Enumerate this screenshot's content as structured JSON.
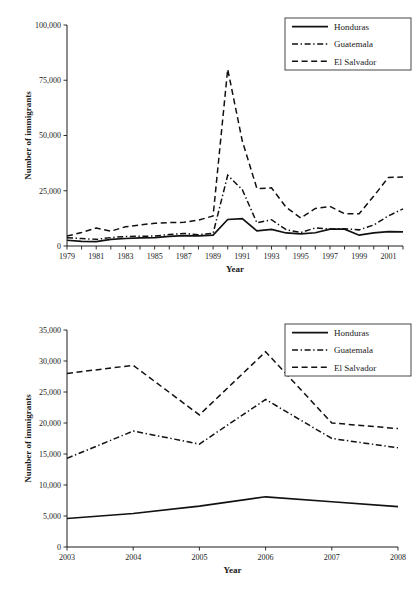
{
  "chart_data": [
    {
      "id": "top",
      "type": "line",
      "title": "",
      "xlabel": "Year",
      "ylabel": "Number of immigrants",
      "xlim": [
        1979,
        2002
      ],
      "ylim": [
        0,
        100000
      ],
      "ytick_labels": [
        "0",
        "25,000",
        "50,000",
        "75,000",
        "100,000"
      ],
      "ytick_values": [
        0,
        25000,
        50000,
        75000,
        100000
      ],
      "x": [
        1979,
        1980,
        1981,
        1982,
        1983,
        1984,
        1985,
        1986,
        1987,
        1988,
        1989,
        1990,
        1991,
        1992,
        1993,
        1994,
        1995,
        1996,
        1997,
        1998,
        1999,
        2000,
        2001,
        2002
      ],
      "xtick_labels": [
        "1979",
        "",
        "1981",
        "",
        "1983",
        "",
        "1985",
        "",
        "1987",
        "",
        "1989",
        "",
        "1991",
        "",
        "1993",
        "",
        "1995",
        "",
        "1997",
        "",
        "1999",
        "",
        "2001",
        ""
      ],
      "grid": false,
      "legend_position": "top-right",
      "series": [
        {
          "name": "Honduras",
          "style": "solid",
          "values": [
            2600,
            2100,
            2000,
            3000,
            3400,
            3700,
            3800,
            4400,
            4700,
            4600,
            4900,
            12000,
            12400,
            6800,
            7500,
            5900,
            5500,
            6000,
            7600,
            7600,
            4900,
            5900,
            6500,
            6400
          ]
        },
        {
          "name": "Guatemala",
          "style": "dashdot",
          "values": [
            3700,
            3400,
            3000,
            3800,
            4300,
            4400,
            4500,
            5200,
            5700,
            5100,
            5700,
            32000,
            25500,
            10500,
            11900,
            7400,
            6100,
            8200,
            7700,
            7800,
            7300,
            9500,
            13600,
            16800
          ]
        },
        {
          "name": "El Salvador",
          "style": "dashed",
          "values": [
            4500,
            6100,
            8100,
            6700,
            8700,
            9500,
            10300,
            10600,
            10700,
            11700,
            13600,
            80000,
            47500,
            26000,
            26300,
            17500,
            12700,
            17000,
            17900,
            14600,
            14600,
            22600,
            31000,
            31200
          ]
        }
      ]
    },
    {
      "id": "bottom",
      "type": "line",
      "title": "",
      "xlabel": "Year",
      "ylabel": "Number of immigrants",
      "xlim": [
        2003,
        2008
      ],
      "ylim": [
        0,
        35000
      ],
      "ytick_labels": [
        "0",
        "5,000",
        "10,000",
        "15,000",
        "20,000",
        "25,000",
        "30,000",
        "35,000"
      ],
      "ytick_values": [
        0,
        5000,
        10000,
        15000,
        20000,
        25000,
        30000,
        35000
      ],
      "x": [
        2003,
        2004,
        2005,
        2006,
        2007,
        2008
      ],
      "xtick_labels": [
        "2003",
        "2004",
        "2005",
        "2006",
        "2007",
        "2008"
      ],
      "grid": false,
      "legend_position": "top-right",
      "series": [
        {
          "name": "Honduras",
          "style": "solid",
          "values": [
            4600,
            5400,
            6600,
            8100,
            7300,
            6500
          ]
        },
        {
          "name": "Guatemala",
          "style": "dashdot",
          "values": [
            14300,
            18700,
            16600,
            23800,
            17500,
            16000
          ]
        },
        {
          "name": "El Salvador",
          "style": "dashed",
          "values": [
            28000,
            29300,
            21300,
            31500,
            20000,
            19100
          ]
        }
      ]
    }
  ],
  "figures": {
    "top": {
      "ylabel": "Number of immigrants",
      "xlabel": "Year",
      "legend": {
        "items": [
          {
            "label": "Honduras",
            "style": "solid"
          },
          {
            "label": "Guatemala",
            "style": "dashdot"
          },
          {
            "label": "El Salvador",
            "style": "dashed"
          }
        ]
      }
    },
    "bottom": {
      "ylabel": "Number of immigrants",
      "xlabel": "Year",
      "legend": {
        "items": [
          {
            "label": "Honduras",
            "style": "solid"
          },
          {
            "label": "Guatemala",
            "style": "dashdot"
          },
          {
            "label": "El Salvador",
            "style": "dashed"
          }
        ]
      }
    }
  }
}
